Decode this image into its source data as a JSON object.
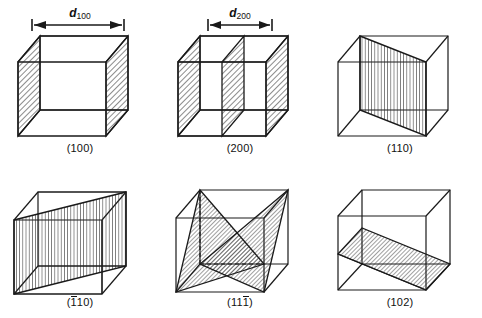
{
  "figure": {
    "line_color": "#1a1a1a",
    "hatch_color": "#2b2b2b",
    "background": "#ffffff"
  },
  "dimensions": [
    {
      "id": "d100",
      "symbol": "d",
      "subscript": "100",
      "cell": "(100)"
    },
    {
      "id": "d200",
      "symbol": "d",
      "subscript": "200",
      "cell": "(200)"
    }
  ],
  "cells": [
    {
      "id": "cell-100",
      "label": "(100)",
      "indices": "100",
      "overbar_positions": [],
      "plane_count": 2,
      "hatch": "diagonal",
      "description": "Two opposing vertical faces hatched"
    },
    {
      "id": "cell-200",
      "label": "(200)",
      "indices": "200",
      "overbar_positions": [],
      "plane_count": 3,
      "hatch": "diagonal",
      "description": "Three parallel vertical planes at half-spacing"
    },
    {
      "id": "cell-110",
      "label": "(110)",
      "indices": "110",
      "overbar_positions": [],
      "plane_count": 1,
      "hatch": "vertical",
      "description": "Vertical diagonal plane across the cell"
    },
    {
      "id": "cell-bar110",
      "label": "(110)",
      "indices": "110",
      "overbar_positions": [
        0
      ],
      "plane_count": 1,
      "hatch": "vertical",
      "description": "Vertical diagonal plane on the opposite diagonal"
    },
    {
      "id": "cell-11bar1",
      "label": "(111)",
      "indices": "111",
      "overbar_positions": [
        2
      ],
      "plane_count": 2,
      "hatch": "diagonal",
      "description": "Two intersecting triangular planes forming an X"
    },
    {
      "id": "cell-102",
      "label": "(102)",
      "indices": "102",
      "overbar_positions": [],
      "plane_count": 1,
      "hatch": "diagonal",
      "description": "Inclined plane sloping through the cell"
    }
  ]
}
